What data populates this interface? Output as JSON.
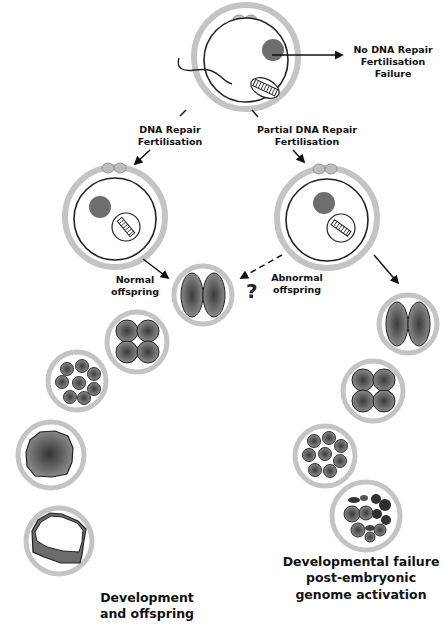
{
  "labels": {
    "no_repair": [
      "No DNA Repair",
      "Fertilisation",
      "Failure"
    ],
    "repair": [
      "DNA Repair",
      "Fertilisation"
    ],
    "partial_repair": [
      "Partial DNA Repair",
      "Fertilisation"
    ],
    "normal_offspring": [
      "Normal",
      "offspring"
    ],
    "abnormal_offspring": [
      "Abnormal",
      "offspring"
    ],
    "question_mark": "?",
    "development": [
      "Development",
      "and offspring"
    ],
    "failure": [
      "Developmental failure",
      "post-embryonic",
      "genome activation"
    ]
  },
  "colors": {
    "zona": "#c4c4c4",
    "membrane": "#222222",
    "nucleus": "#6e6e6e",
    "cell_fill": "#7a7a7a",
    "cell_center": "#3a3a3a",
    "polar_body": "#bdbdbd"
  },
  "stages": {
    "left": [
      "zygote",
      "2-cell",
      "4-cell",
      "8-cell",
      "morula",
      "blastocyst"
    ],
    "right": [
      "zygote",
      "2-cell",
      "4-cell",
      "8-cell",
      "fragmented"
    ]
  }
}
